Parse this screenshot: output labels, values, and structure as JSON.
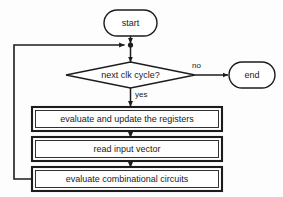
{
  "diagram": {
    "type": "flowchart",
    "colors": {
      "background": "#fdfdfd",
      "stroke": "#1c1c1c",
      "shape_fill": "#ffffff",
      "text": "#1a1a1a"
    },
    "nodes": {
      "start": {
        "label": "start",
        "shape": "stadium"
      },
      "decision": {
        "label": "next clk cycle?",
        "shape": "diamond"
      },
      "end": {
        "label": "end",
        "shape": "stadium"
      },
      "process_1": {
        "label": "evaluate and update the registers",
        "shape": "double-rect"
      },
      "process_2": {
        "label": "read input vector",
        "shape": "double-rect"
      },
      "process_3": {
        "label": "evaluate combinational circuits",
        "shape": "double-rect"
      }
    },
    "edge_labels": {
      "no": "no",
      "yes": "yes"
    }
  }
}
